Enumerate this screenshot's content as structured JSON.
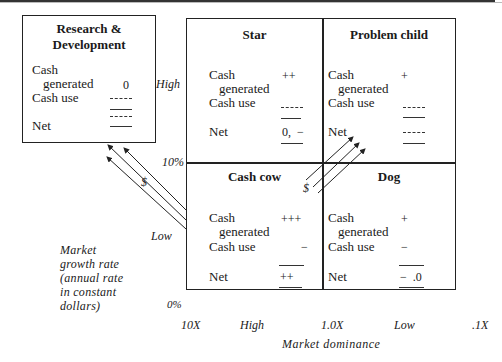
{
  "rd_box": {
    "title_line1": "Research &",
    "title_line2": "Development",
    "cash_generated_label_1": "Cash",
    "cash_generated_label_2": "generated",
    "cash_generated_value": "0",
    "cash_use_label": "Cash use",
    "net_label": "Net"
  },
  "quadrants": {
    "star": {
      "title": "Star",
      "cash_1": "Cash",
      "cash_2": "generated",
      "cash_generated": "++",
      "cash_use_label": "Cash use",
      "net_label": "Net",
      "net_value": "0,  −"
    },
    "problem_child": {
      "title": "Problem child",
      "cash_1": "Cash",
      "cash_2": "generated",
      "cash_generated": "+",
      "cash_use_label": "Cash use",
      "net_label": "Net"
    },
    "cash_cow": {
      "title": "Cash cow",
      "cash_1": "Cash",
      "cash_2": "generated",
      "cash_generated": "+++",
      "cash_use_label": "Cash use",
      "cash_use": "−",
      "net_label": "Net",
      "net_value": "++"
    },
    "dog": {
      "title": "Dog",
      "cash_1": "Cash",
      "cash_2": "generated",
      "cash_generated": "+",
      "cash_use_label": "Cash use",
      "cash_use": "−",
      "net_label": "Net",
      "net_value": "−  .0"
    }
  },
  "y_axis": {
    "high": "High",
    "ten_pct": "10%",
    "low": "Low",
    "zero_pct": "0%",
    "title_lines": [
      "Market",
      "growth rate",
      "(annual rate",
      "in constant",
      "dollars)"
    ]
  },
  "x_axis": {
    "ticks": [
      "10X",
      "High",
      "1.0X",
      "Low",
      ".1X"
    ],
    "title": "Market dominance"
  },
  "flows": {
    "to_rd_label": "$",
    "to_problem_child_label": "$"
  }
}
